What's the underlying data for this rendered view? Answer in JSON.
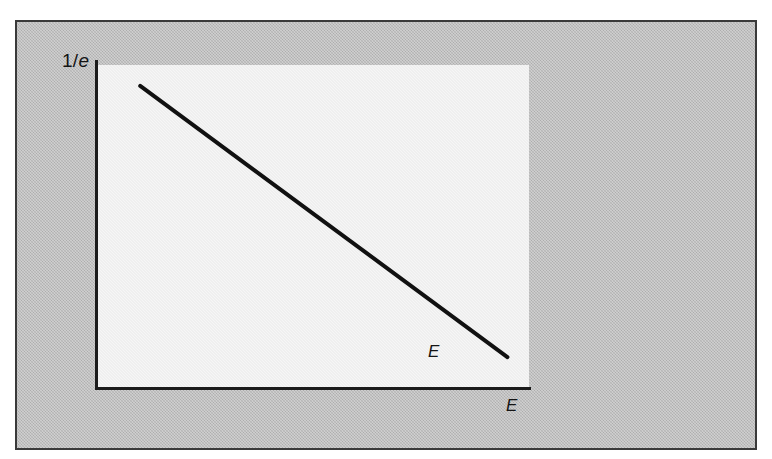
{
  "figure": {
    "panel_background_color": "#bcbcbc",
    "panel_border_color": "#3a3a3a",
    "plot_field_color": "#f2f2f2",
    "axis_color": "#1b1b1b",
    "curve_color": "#111111",
    "top_cropped_text": ""
  },
  "labels": {
    "y_axis_value": "1/",
    "y_axis_value_italic": "e",
    "curve_end": "E",
    "x_axis": "E"
  },
  "chart_data": {
    "type": "line",
    "title": "",
    "subtitle": "",
    "xlabel": "E",
    "ylabel": "1/e",
    "legend": [],
    "grid": false,
    "legend_position": "none",
    "xlim": [
      0,
      1
    ],
    "ylim": [
      0,
      1
    ],
    "xticks": [],
    "yticks": [],
    "ytick_labels": [
      "1/e"
    ],
    "annotations": [
      {
        "text": "1/e",
        "position": "y-axis-top",
        "italic_part": "e"
      },
      {
        "text": "E",
        "position": "curve-end",
        "italic": true
      },
      {
        "text": "E",
        "position": "x-axis-right",
        "italic": true
      }
    ],
    "series": [
      {
        "name": "decay",
        "x": [
          0.1,
          0.95
        ],
        "y": [
          0.935,
          0.093
        ],
        "style": "solid",
        "color": "#111111",
        "width": 4
      }
    ]
  }
}
